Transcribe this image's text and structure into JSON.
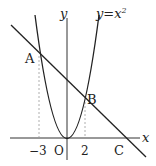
{
  "diagram": {
    "type": "coordinate-graph",
    "axes": {
      "x_label": "x",
      "y_label": "y",
      "origin_label": "O"
    },
    "curve_label": "y=x²",
    "curve_label_base": "y=x",
    "curve_label_exp": "2",
    "ticks": [
      {
        "value": -3,
        "label": "−3"
      },
      {
        "value": 2,
        "label": "2"
      }
    ],
    "points": [
      {
        "name": "A",
        "x": -3,
        "y": 9
      },
      {
        "name": "B",
        "x": 2,
        "y": 4
      },
      {
        "name": "C",
        "x": 6,
        "y": 0
      }
    ],
    "colors": {
      "stroke": "#222222",
      "dashed": "#888888",
      "background": "#ffffff"
    }
  }
}
